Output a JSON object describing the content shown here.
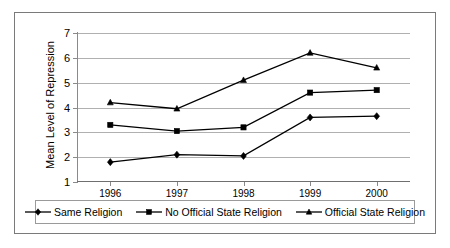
{
  "chart_data": {
    "type": "line",
    "title": "",
    "subtitle": "",
    "xlabel": "",
    "ylabel": "Mean Level of Repression",
    "categories": [
      "1996",
      "1997",
      "1998",
      "1999",
      "2000"
    ],
    "x_tick_labels": [
      "1996",
      "1997",
      "1998",
      "1999",
      "2000"
    ],
    "y_tick_labels": [
      "1",
      "2",
      "3",
      "4",
      "5",
      "6",
      "7"
    ],
    "ylim": [
      1,
      7
    ],
    "y_ticks": [
      1,
      2,
      3,
      4,
      5,
      6,
      7
    ],
    "grid": true,
    "grid_axis": "y",
    "legend_position": "bottom",
    "series": [
      {
        "name": "Same Religion",
        "marker": "diamond",
        "color": "#000000",
        "values": [
          1.8,
          2.1,
          2.05,
          3.6,
          3.65
        ]
      },
      {
        "name": "No Official State Religion",
        "marker": "square",
        "color": "#000000",
        "values": [
          3.3,
          3.05,
          3.2,
          4.6,
          4.7
        ]
      },
      {
        "name": "Official State Religion",
        "marker": "triangle",
        "color": "#000000",
        "values": [
          4.2,
          3.95,
          5.1,
          6.2,
          5.6
        ]
      }
    ]
  },
  "legend": {
    "entries": [
      {
        "label": "Same Religion",
        "marker": "diamond"
      },
      {
        "label": "No Official State Religion",
        "marker": "square"
      },
      {
        "label": "Official State Religion",
        "marker": "triangle"
      }
    ]
  },
  "colors": {
    "series": "#000000",
    "gridline": "#b0b0b0",
    "axis": "#8a8a8a",
    "frame": "#7a7a7a",
    "background": "#ffffff"
  }
}
